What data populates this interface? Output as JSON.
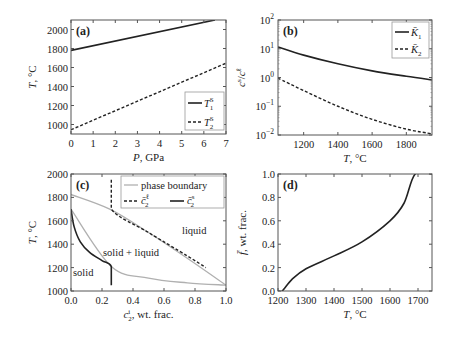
{
  "figure": {
    "panels": [
      "(a)",
      "(b)",
      "(c)",
      "(d)"
    ]
  },
  "chart_data": [
    {
      "panel": "(a)",
      "type": "line",
      "xlabel": "P, GPa",
      "ylabel": "T, °C",
      "xlim": [
        0,
        7
      ],
      "ylim": [
        900,
        2100
      ],
      "xticks": [
        "0",
        "1",
        "2",
        "3",
        "4",
        "5",
        "6",
        "7"
      ],
      "yticks": [
        "1000",
        "1200",
        "1400",
        "1600",
        "1800",
        "2000"
      ],
      "legend": {
        "position": "lower right",
        "entries": [
          "T₁ˢ",
          "T₂ˢ"
        ]
      },
      "series": [
        {
          "name": "T1S",
          "style": "solid",
          "x": [
            0,
            6.5
          ],
          "y": [
            1780,
            2100
          ]
        },
        {
          "name": "T2S",
          "style": "dashed",
          "x": [
            0,
            7
          ],
          "y": [
            945,
            1645
          ]
        }
      ]
    },
    {
      "panel": "(b)",
      "type": "line",
      "xlabel": "T, °C",
      "ylabel": "cⱼˢ/cⱼℓ",
      "xlim": [
        1050,
        1950
      ],
      "yscale": "log",
      "ylim": [
        0.01,
        100
      ],
      "xticks": [
        "1200",
        "1400",
        "1600",
        "1800"
      ],
      "yticks": [
        "10²",
        "10¹",
        "10⁰",
        "10⁻¹",
        "10⁻²"
      ],
      "legend": {
        "position": "upper right",
        "entries": [
          "K̄₁",
          "K̄₂"
        ]
      },
      "series": [
        {
          "name": "K1",
          "style": "solid",
          "x": [
            1050,
            1200,
            1400,
            1600,
            1800,
            1950
          ],
          "y": [
            11.5,
            6.0,
            3.0,
            1.7,
            1.1,
            0.82
          ]
        },
        {
          "name": "K2",
          "style": "dashed",
          "x": [
            1050,
            1200,
            1400,
            1600,
            1800,
            1950
          ],
          "y": [
            0.95,
            0.35,
            0.1,
            0.035,
            0.016,
            0.011
          ]
        }
      ]
    },
    {
      "panel": "(c)",
      "type": "line",
      "xlabel": "cⱼⁱ, wt. frac.",
      "ylabel": "T, °C",
      "xlim": [
        0,
        1
      ],
      "ylim": [
        1000,
        2000
      ],
      "xticks": [
        "0.0",
        "0.2",
        "0.4",
        "0.6",
        "0.8",
        "1.0"
      ],
      "yticks": [
        "1000",
        "1200",
        "1400",
        "1600",
        "1800",
        "2000"
      ],
      "legend": {
        "position": "upper right",
        "entries": [
          "phase boundary",
          "c̄₂ℓ",
          "c̄₂ˢ"
        ]
      },
      "annotations": [
        "liquid",
        "solid + liquid",
        "solid"
      ],
      "series": [
        {
          "name": "liquidus",
          "style": "solid-gray",
          "x": [
            0,
            0.25,
            0.5,
            0.75,
            1.0
          ],
          "y": [
            1825,
            1700,
            1500,
            1280,
            1050
          ]
        },
        {
          "name": "solidus",
          "style": "solid-gray",
          "x": [
            0,
            0.26,
            0.5,
            0.75,
            1.0
          ],
          "y": [
            1700,
            1210,
            1110,
            1070,
            1050
          ]
        },
        {
          "name": "c2_liquid",
          "style": "dashed",
          "x": [
            0.26,
            0.26,
            0.5,
            0.75,
            0.87
          ],
          "y": [
            1950,
            1700,
            1500,
            1300,
            1200
          ]
        },
        {
          "name": "c2_solid",
          "style": "solid",
          "x": [
            0.0,
            0.02,
            0.06,
            0.12,
            0.2,
            0.26,
            0.26
          ],
          "y": [
            1700,
            1550,
            1420,
            1330,
            1260,
            1210,
            1050
          ]
        }
      ]
    },
    {
      "panel": "(d)",
      "type": "line",
      "xlabel": "T, °C",
      "ylabel": "f̄, wt. frac.",
      "xlim": [
        1200,
        1750
      ],
      "ylim": [
        0,
        1
      ],
      "xticks": [
        "1200",
        "1300",
        "1400",
        "1500",
        "1600",
        "1700"
      ],
      "yticks": [
        "0.0",
        "0.2",
        "0.4",
        "0.6",
        "0.8",
        "1.0"
      ],
      "series": [
        {
          "name": "f",
          "style": "solid",
          "x": [
            1200,
            1215,
            1250,
            1300,
            1400,
            1500,
            1600,
            1650,
            1690,
            1750
          ],
          "y": [
            0,
            0,
            0.1,
            0.19,
            0.3,
            0.42,
            0.6,
            0.75,
            1.0,
            1.0
          ]
        }
      ]
    }
  ],
  "labels": {
    "a": {
      "panel": "(a)",
      "xlabel": "P, GPa",
      "ylabel": "T, °C",
      "leg1": "T",
      "leg1_sup": "S",
      "leg1_sub": "1",
      "leg2": "T",
      "leg2_sup": "S",
      "leg2_sub": "2"
    },
    "b": {
      "panel": "(b)",
      "xlabel": "T, °C",
      "leg1": "K̄",
      "leg1_sub": "1",
      "leg2": "K̄",
      "leg2_sub": "2"
    },
    "c": {
      "panel": "(c)",
      "xlabel": "c",
      "xlabel_rest": ", wt. frac.",
      "ylabel": "T, °C",
      "leg1": "phase boundary",
      "leg2": "c̄",
      "leg3": "c̄",
      "region_liquid": "liquid",
      "region_mixed": "solid + liquid",
      "region_solid": "solid"
    },
    "d": {
      "panel": "(d)",
      "xlabel": "T, °C",
      "ylabel": "f̄, wt. frac."
    }
  }
}
